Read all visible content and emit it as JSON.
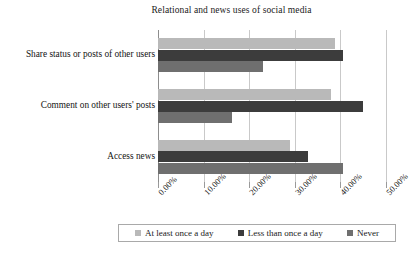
{
  "chart_data": {
    "type": "bar",
    "orientation": "horizontal",
    "title": "Relational and news uses of social media",
    "xlabel": "",
    "ylabel": "",
    "xlim": [
      0,
      50
    ],
    "xticks": [
      "0.00%",
      "10.00%",
      "20.00%",
      "30.00%",
      "40.00%",
      "50.00%"
    ],
    "xtick_values": [
      0,
      10,
      20,
      30,
      40,
      50
    ],
    "grid": true,
    "legend_position": "bottom",
    "categories": [
      "Share status or posts of other users",
      "Comment on other users' posts",
      "Access news"
    ],
    "series": [
      {
        "name": "At least once a day",
        "color": "#b9b9b9",
        "values": [
          38.8,
          38.0,
          29.0
        ]
      },
      {
        "name": "Less than once a day",
        "color": "#3c3c3c",
        "values": [
          40.5,
          45.0,
          33.0
        ]
      },
      {
        "name": "Never",
        "color": "#6f6f6f",
        "values": [
          23.0,
          16.2,
          40.5
        ]
      }
    ]
  }
}
